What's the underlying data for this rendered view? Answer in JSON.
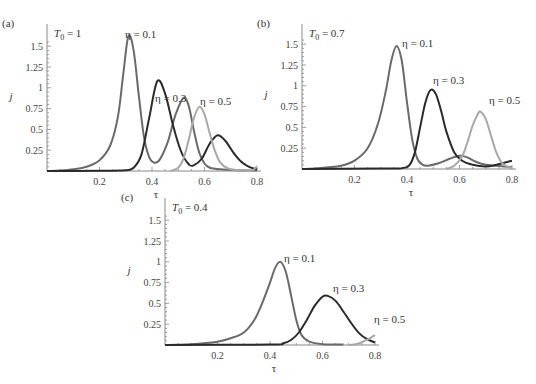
{
  "chart_data": [
    {
      "type": "line",
      "panel_label": "(a)",
      "title": "T0 = 1",
      "title_main": "T",
      "title_sub": "0",
      "title_rest": " = 1",
      "xlabel": "τ",
      "ylabel": "j",
      "xlim": [
        0,
        0.8
      ],
      "ylim": [
        0,
        1.65
      ],
      "xticks": [
        0.2,
        0.4,
        0.6,
        0.8
      ],
      "xtick_labels": [
        "0.2",
        "0.4",
        "0.6",
        "0.8"
      ],
      "yticks": [
        0.25,
        0.5,
        0.75,
        1,
        1.25,
        1.5
      ],
      "ytick_labels": [
        "0.25",
        "0.5",
        "0.75",
        "1",
        "1.25",
        "1.5"
      ],
      "grid": false,
      "box": {
        "x0": 47,
        "y0": 171,
        "x1": 257,
        "y1": 30,
        "ypx_per_unit": 83.2
      },
      "series": [
        {
          "name": "η = 0.1",
          "color": "#6a6a6a",
          "label_pos": [
            125,
            38
          ],
          "points": [
            [
              0.0,
              0
            ],
            [
              0.05,
              0.005
            ],
            [
              0.1,
              0.02
            ],
            [
              0.15,
              0.05
            ],
            [
              0.2,
              0.13
            ],
            [
              0.24,
              0.3
            ],
            [
              0.27,
              0.65
            ],
            [
              0.29,
              1.15
            ],
            [
              0.31,
              1.62
            ],
            [
              0.33,
              1.45
            ],
            [
              0.35,
              0.9
            ],
            [
              0.37,
              0.4
            ],
            [
              0.39,
              0.16
            ],
            [
              0.41,
              0.1
            ],
            [
              0.43,
              0.14
            ],
            [
              0.46,
              0.35
            ],
            [
              0.49,
              0.68
            ],
            [
              0.52,
              0.88
            ],
            [
              0.54,
              0.78
            ],
            [
              0.56,
              0.48
            ],
            [
              0.58,
              0.22
            ],
            [
              0.6,
              0.09
            ],
            [
              0.62,
              0.04
            ],
            [
              0.66,
              0.02
            ],
            [
              0.72,
              0.01
            ],
            [
              0.8,
              0.005
            ]
          ]
        },
        {
          "name": "η = 0.3",
          "color": "#2a2a2a",
          "label_pos": [
            155,
            102
          ],
          "points": [
            [
              0.0,
              0
            ],
            [
              0.2,
              0.002
            ],
            [
              0.3,
              0.01
            ],
            [
              0.33,
              0.04
            ],
            [
              0.36,
              0.2
            ],
            [
              0.39,
              0.65
            ],
            [
              0.42,
              1.08
            ],
            [
              0.45,
              0.93
            ],
            [
              0.48,
              0.55
            ],
            [
              0.51,
              0.24
            ],
            [
              0.54,
              0.08
            ],
            [
              0.56,
              0.07
            ],
            [
              0.59,
              0.15
            ],
            [
              0.62,
              0.33
            ],
            [
              0.65,
              0.43
            ],
            [
              0.68,
              0.36
            ],
            [
              0.71,
              0.22
            ],
            [
              0.74,
              0.11
            ],
            [
              0.77,
              0.05
            ],
            [
              0.8,
              0.02
            ]
          ]
        },
        {
          "name": "η = 0.5",
          "color": "#a8a8a8",
          "label_pos": [
            200,
            105
          ],
          "points": [
            [
              0.47,
              0
            ],
            [
              0.5,
              0.04
            ],
            [
              0.52,
              0.15
            ],
            [
              0.54,
              0.38
            ],
            [
              0.56,
              0.64
            ],
            [
              0.58,
              0.77
            ],
            [
              0.6,
              0.68
            ],
            [
              0.62,
              0.45
            ],
            [
              0.64,
              0.24
            ],
            [
              0.66,
              0.1
            ],
            [
              0.69,
              0.03
            ],
            [
              0.73,
              0.01
            ],
            [
              0.78,
              0.005
            ],
            [
              0.8,
              0.06
            ]
          ]
        }
      ]
    },
    {
      "type": "line",
      "panel_label": "(b)",
      "title": "T0 = 0.7",
      "title_main": "T",
      "title_sub": "0",
      "title_rest": " = 0.7",
      "xlabel": "τ",
      "ylabel": "j",
      "xlim": [
        0,
        0.8
      ],
      "ylim": [
        0,
        1.65
      ],
      "xticks": [
        0.2,
        0.4,
        0.6,
        0.8
      ],
      "xtick_labels": [
        "0.2",
        "0.4",
        "0.6",
        "0.8"
      ],
      "yticks": [
        0.25,
        0.5,
        0.75,
        1,
        1.25,
        1.5
      ],
      "ytick_labels": [
        "0.25",
        "0.5",
        "0.75",
        "1",
        "1.25",
        "1.5"
      ],
      "grid": false,
      "box": {
        "x0": 302,
        "y0": 169,
        "x1": 512,
        "y1": 30,
        "ypx_per_unit": 83.2
      },
      "series": [
        {
          "name": "η = 0.1",
          "color": "#6a6a6a",
          "label_pos": [
            402,
            47
          ],
          "points": [
            [
              0.0,
              0
            ],
            [
              0.05,
              0.005
            ],
            [
              0.1,
              0.02
            ],
            [
              0.15,
              0.04
            ],
            [
              0.2,
              0.1
            ],
            [
              0.25,
              0.25
            ],
            [
              0.29,
              0.55
            ],
            [
              0.32,
              0.95
            ],
            [
              0.34,
              1.3
            ],
            [
              0.36,
              1.48
            ],
            [
              0.38,
              1.3
            ],
            [
              0.4,
              0.8
            ],
            [
              0.42,
              0.35
            ],
            [
              0.44,
              0.12
            ],
            [
              0.46,
              0.05
            ],
            [
              0.48,
              0.04
            ],
            [
              0.52,
              0.07
            ],
            [
              0.56,
              0.12
            ],
            [
              0.6,
              0.16
            ],
            [
              0.63,
              0.14
            ],
            [
              0.66,
              0.09
            ],
            [
              0.7,
              0.05
            ],
            [
              0.74,
              0.04
            ],
            [
              0.8,
              0.02
            ]
          ]
        },
        {
          "name": "η = 0.3",
          "color": "#2a2a2a",
          "label_pos": [
            433,
            84
          ],
          "points": [
            [
              0.0,
              0
            ],
            [
              0.3,
              0.005
            ],
            [
              0.38,
              0.01
            ],
            [
              0.41,
              0.05
            ],
            [
              0.43,
              0.2
            ],
            [
              0.45,
              0.5
            ],
            [
              0.47,
              0.8
            ],
            [
              0.49,
              0.95
            ],
            [
              0.51,
              0.9
            ],
            [
              0.53,
              0.7
            ],
            [
              0.55,
              0.45
            ],
            [
              0.58,
              0.2
            ],
            [
              0.61,
              0.1
            ],
            [
              0.65,
              0.05
            ],
            [
              0.7,
              0.03
            ],
            [
              0.74,
              0.05
            ],
            [
              0.8,
              0.1
            ]
          ]
        },
        {
          "name": "η = 0.5",
          "color": "#a8a8a8",
          "label_pos": [
            489,
            104
          ],
          "points": [
            [
              0.55,
              0
            ],
            [
              0.58,
              0.04
            ],
            [
              0.61,
              0.15
            ],
            [
              0.63,
              0.32
            ],
            [
              0.65,
              0.52
            ],
            [
              0.67,
              0.66
            ],
            [
              0.68,
              0.69
            ],
            [
              0.7,
              0.6
            ],
            [
              0.72,
              0.4
            ],
            [
              0.74,
              0.2
            ],
            [
              0.76,
              0.08
            ],
            [
              0.78,
              0.03
            ],
            [
              0.8,
              0.01
            ]
          ]
        }
      ]
    },
    {
      "type": "line",
      "panel_label": "(c)",
      "title": "T0 = 0.4",
      "title_main": "T",
      "title_sub": "0",
      "title_rest": " = 0.4",
      "xlabel": "τ",
      "ylabel": "j",
      "xlim": [
        0,
        0.8
      ],
      "ylim": [
        0,
        1.65
      ],
      "xticks": [
        0.2,
        0.4,
        0.6,
        0.8
      ],
      "xtick_labels": [
        "0.2",
        "0.4",
        "0.6",
        "0.8"
      ],
      "yticks": [
        0.25,
        0.5,
        0.75,
        1,
        1.25,
        1.5
      ],
      "ytick_labels": [
        "0.25",
        "0.5",
        "0.75",
        "1",
        "1.25",
        "1.5"
      ],
      "grid": false,
      "box": {
        "x0": 165,
        "y0": 345,
        "x1": 375,
        "y1": 204,
        "ypx_per_unit": 83.2
      },
      "series": [
        {
          "name": "η = 0.1",
          "color": "#6a6a6a",
          "label_pos": [
            284,
            262
          ],
          "points": [
            [
              0.0,
              0
            ],
            [
              0.1,
              0.01
            ],
            [
              0.2,
              0.04
            ],
            [
              0.25,
              0.08
            ],
            [
              0.3,
              0.15
            ],
            [
              0.34,
              0.3
            ],
            [
              0.37,
              0.5
            ],
            [
              0.4,
              0.75
            ],
            [
              0.42,
              0.93
            ],
            [
              0.44,
              1.0
            ],
            [
              0.46,
              0.88
            ],
            [
              0.48,
              0.6
            ],
            [
              0.5,
              0.3
            ],
            [
              0.52,
              0.12
            ],
            [
              0.55,
              0.04
            ],
            [
              0.6,
              0.01
            ],
            [
              0.68,
              0.005
            ]
          ]
        },
        {
          "name": "η = 0.3",
          "color": "#2a2a2a",
          "label_pos": [
            333,
            292
          ],
          "points": [
            [
              0.0,
              0
            ],
            [
              0.4,
              0.005
            ],
            [
              0.45,
              0.02
            ],
            [
              0.48,
              0.06
            ],
            [
              0.51,
              0.15
            ],
            [
              0.54,
              0.3
            ],
            [
              0.57,
              0.47
            ],
            [
              0.6,
              0.58
            ],
            [
              0.62,
              0.59
            ],
            [
              0.65,
              0.53
            ],
            [
              0.68,
              0.4
            ],
            [
              0.71,
              0.26
            ],
            [
              0.74,
              0.14
            ],
            [
              0.77,
              0.07
            ],
            [
              0.8,
              0.03
            ]
          ]
        },
        {
          "name": "η = 0.5",
          "color": "#a8a8a8",
          "label_pos": [
            374,
            323
          ],
          "points": [
            [
              0.7,
              0
            ],
            [
              0.72,
              0.005
            ],
            [
              0.74,
              0.02
            ],
            [
              0.76,
              0.05
            ],
            [
              0.78,
              0.08
            ],
            [
              0.8,
              0.12
            ]
          ]
        }
      ]
    }
  ]
}
